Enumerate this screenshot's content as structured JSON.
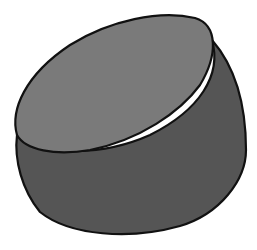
{
  "illustration": {
    "subject": "cylinder",
    "colors": {
      "background": "#ffffff",
      "top_face": "#7a7a7a",
      "side_face": "#555555",
      "outline": "#111111"
    }
  }
}
